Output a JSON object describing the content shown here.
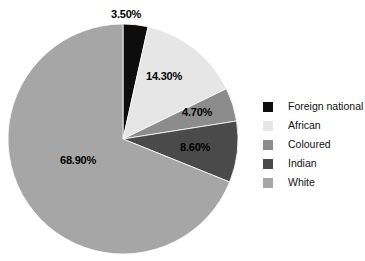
{
  "chart_data": {
    "type": "pie",
    "title": "",
    "subtitle": "",
    "xlabel": "",
    "ylabel": "",
    "legend_position": "right",
    "grid": false,
    "categories": [
      "Foreign national",
      "African",
      "Coloured",
      "Indian",
      "White"
    ],
    "values": [
      3.5,
      14.3,
      4.7,
      8.6,
      68.9
    ],
    "data_labels": [
      "3.50%",
      "14.30%",
      "4.70%",
      "8.60%",
      "68.90%"
    ],
    "colors": [
      "#0d0d0d",
      "#e6e6e6",
      "#8c8c8c",
      "#4a4a4a",
      "#a6a6a6"
    ],
    "start_angle_deg": 0,
    "direction": "clockwise",
    "units": "percent"
  },
  "legend": {
    "items": [
      {
        "label": "Foreign national",
        "color": "#0d0d0d"
      },
      {
        "label": "African",
        "color": "#e6e6e6"
      },
      {
        "label": "Coloured",
        "color": "#8c8c8c"
      },
      {
        "label": "Indian",
        "color": "#4a4a4a"
      },
      {
        "label": "White",
        "color": "#a6a6a6"
      }
    ]
  },
  "labels": {
    "foreign_national": "3.50%",
    "african": "14.30%",
    "coloured": "4.70%",
    "indian": "8.60%",
    "white": "68.90%"
  }
}
